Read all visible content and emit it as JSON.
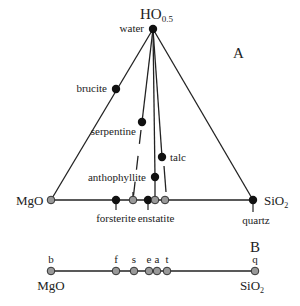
{
  "diagram": {
    "panel_a": {
      "label": "A",
      "vertices": {
        "top": {
          "formula": "HO",
          "subscript": "0.5",
          "mineral": "water"
        },
        "left": {
          "formula": "MgO"
        },
        "right": {
          "formula": "SiO",
          "subscript": "2",
          "mineral": "quartz"
        }
      },
      "minerals": [
        {
          "name": "brucite"
        },
        {
          "name": "serpentine"
        },
        {
          "name": "talc"
        },
        {
          "name": "anthophyllite"
        },
        {
          "name": "forsterite"
        },
        {
          "name": "enstatite"
        }
      ]
    },
    "panel_b": {
      "label": "B",
      "left": {
        "formula": "MgO"
      },
      "right": {
        "formula": "SiO",
        "subscript": "2"
      },
      "points": [
        {
          "abbr": "b"
        },
        {
          "abbr": "f"
        },
        {
          "abbr": "s"
        },
        {
          "abbr": "e"
        },
        {
          "abbr": "a"
        },
        {
          "abbr": "t"
        },
        {
          "abbr": "q"
        }
      ]
    },
    "colors": {
      "line": "#222222",
      "solid_dot": "#111111",
      "projected_dot": "#999999"
    }
  }
}
